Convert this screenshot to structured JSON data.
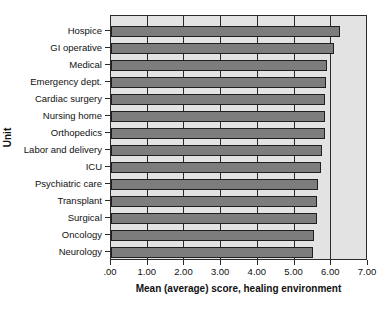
{
  "chart_data": {
    "type": "bar",
    "orientation": "horizontal",
    "title": "",
    "xlabel": "Mean (average) score, healing environment",
    "ylabel": "Unit",
    "categories": [
      "Hospice",
      "GI operative",
      "Medical",
      "Emergency dept.",
      "Cardiac surgery",
      "Nursing home",
      "Orthopedics",
      "Labor and delivery",
      "ICU",
      "Psychiatric care",
      "Transplant",
      "Surgical",
      "Oncology",
      "Neurology"
    ],
    "values": [
      6.24,
      6.08,
      5.87,
      5.85,
      5.84,
      5.83,
      5.82,
      5.75,
      5.72,
      5.63,
      5.62,
      5.61,
      5.53,
      5.51
    ],
    "xlim": [
      0,
      7
    ],
    "x_tick_labels": [
      ".00",
      "1.00",
      "2.00",
      "3.00",
      "4.00",
      "5.00",
      "6.00",
      "7.00"
    ],
    "x_tick_values": [
      0,
      1,
      2,
      3,
      4,
      5,
      6,
      7
    ],
    "grid": true,
    "legend": false,
    "bar_color": "#7d7d7d",
    "bar_edge_color": "#1f1f1f",
    "plot_background": "#e3e3e3",
    "axis_color": "#2b2b2b"
  }
}
